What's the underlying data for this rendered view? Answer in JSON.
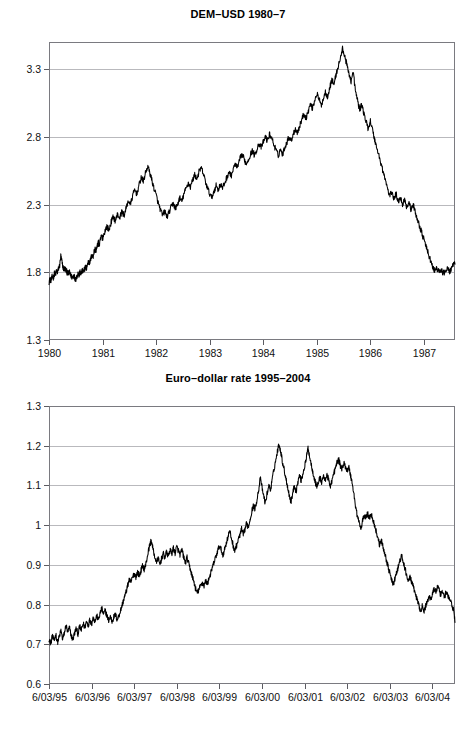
{
  "chart_data": [
    {
      "id": "dem-usd",
      "type": "line",
      "title": "DEM–USD 1980–7",
      "xlabel": "",
      "ylabel": "",
      "grid": true,
      "legend": "none",
      "xlim": [
        1980.0,
        1987.58
      ],
      "ylim": [
        1.3,
        3.5
      ],
      "ytick_labels": [
        "3.3",
        "2.8",
        "2.3",
        "1.8",
        "1.3"
      ],
      "ytick_values": [
        3.3,
        2.8,
        2.3,
        1.8,
        1.3
      ],
      "xtick_labels": [
        "1980",
        "1981",
        "1982",
        "1983",
        "1984",
        "1985",
        "1986",
        "1987"
      ],
      "xtick_values": [
        1980,
        1981,
        1982,
        1983,
        1984,
        1985,
        1986,
        1987
      ],
      "series": [
        {
          "name": "DEM per USD",
          "x": [
            1980.0,
            1980.02,
            1980.04,
            1980.06,
            1980.08,
            1980.1,
            1980.12,
            1980.14,
            1980.16,
            1980.18,
            1980.2,
            1980.22,
            1980.24,
            1980.26,
            1980.28,
            1980.3,
            1980.32,
            1980.34,
            1980.36,
            1980.38,
            1980.4,
            1980.42,
            1980.44,
            1980.46,
            1980.48,
            1980.5,
            1980.52,
            1980.54,
            1980.56,
            1980.58,
            1980.6,
            1980.62,
            1980.64,
            1980.66,
            1980.68,
            1980.7,
            1980.72,
            1980.74,
            1980.76,
            1980.78,
            1980.8,
            1980.82,
            1980.84,
            1980.86,
            1980.88,
            1980.9,
            1980.92,
            1980.94,
            1980.96,
            1980.98,
            1981.0,
            1981.04,
            1981.08,
            1981.12,
            1981.16,
            1981.2,
            1981.24,
            1981.28,
            1981.32,
            1981.36,
            1981.4,
            1981.44,
            1981.48,
            1981.52,
            1981.56,
            1981.6,
            1981.64,
            1981.68,
            1981.72,
            1981.76,
            1981.8,
            1981.84,
            1981.88,
            1981.92,
            1981.96,
            1982.0,
            1982.04,
            1982.08,
            1982.12,
            1982.16,
            1982.2,
            1982.24,
            1982.28,
            1982.32,
            1982.36,
            1982.4,
            1982.44,
            1982.48,
            1982.52,
            1982.56,
            1982.6,
            1982.64,
            1982.68,
            1982.72,
            1982.76,
            1982.8,
            1982.84,
            1982.88,
            1982.92,
            1982.96,
            1983.0,
            1983.04,
            1983.08,
            1983.12,
            1983.16,
            1983.2,
            1983.24,
            1983.28,
            1983.32,
            1983.36,
            1983.4,
            1983.44,
            1983.48,
            1983.52,
            1983.56,
            1983.6,
            1983.64,
            1983.68,
            1983.72,
            1983.76,
            1983.8,
            1983.84,
            1983.88,
            1983.92,
            1983.96,
            1984.0,
            1984.04,
            1984.08,
            1984.12,
            1984.16,
            1984.2,
            1984.24,
            1984.28,
            1984.32,
            1984.36,
            1984.4,
            1984.44,
            1984.48,
            1984.52,
            1984.56,
            1984.6,
            1984.64,
            1984.68,
            1984.72,
            1984.76,
            1984.8,
            1984.84,
            1984.88,
            1984.92,
            1984.96,
            1985.0,
            1985.04,
            1985.08,
            1985.12,
            1985.16,
            1985.2,
            1985.24,
            1985.28,
            1985.32,
            1985.36,
            1985.4,
            1985.44,
            1985.48,
            1985.52,
            1985.56,
            1985.6,
            1985.64,
            1985.68,
            1985.72,
            1985.76,
            1985.8,
            1985.84,
            1985.88,
            1985.92,
            1985.96,
            1986.0,
            1986.04,
            1986.08,
            1986.12,
            1986.16,
            1986.2,
            1986.24,
            1986.28,
            1986.32,
            1986.36,
            1986.4,
            1986.44,
            1986.48,
            1986.52,
            1986.56,
            1986.6,
            1986.64,
            1986.68,
            1986.72,
            1986.76,
            1986.8,
            1986.84,
            1986.88,
            1986.92,
            1986.96,
            1987.0,
            1987.04,
            1987.08,
            1987.12,
            1987.16,
            1987.2,
            1987.24,
            1987.28,
            1987.32,
            1987.36,
            1987.4,
            1987.44,
            1987.48,
            1987.52,
            1987.58
          ],
          "y": [
            1.73,
            1.75,
            1.74,
            1.77,
            1.76,
            1.79,
            1.78,
            1.81,
            1.8,
            1.83,
            1.85,
            1.92,
            1.88,
            1.84,
            1.82,
            1.83,
            1.81,
            1.8,
            1.79,
            1.8,
            1.78,
            1.77,
            1.76,
            1.78,
            1.76,
            1.75,
            1.77,
            1.79,
            1.78,
            1.8,
            1.79,
            1.81,
            1.8,
            1.82,
            1.84,
            1.83,
            1.86,
            1.88,
            1.87,
            1.9,
            1.93,
            1.91,
            1.95,
            1.97,
            1.96,
            1.99,
            2.02,
            2.0,
            2.04,
            2.07,
            2.05,
            2.1,
            2.14,
            2.11,
            2.17,
            2.21,
            2.18,
            2.23,
            2.2,
            2.25,
            2.22,
            2.27,
            2.33,
            2.3,
            2.36,
            2.41,
            2.38,
            2.44,
            2.5,
            2.47,
            2.53,
            2.58,
            2.54,
            2.48,
            2.42,
            2.37,
            2.31,
            2.26,
            2.22,
            2.25,
            2.21,
            2.24,
            2.28,
            2.31,
            2.27,
            2.3,
            2.35,
            2.32,
            2.38,
            2.42,
            2.46,
            2.43,
            2.48,
            2.52,
            2.49,
            2.54,
            2.57,
            2.53,
            2.47,
            2.42,
            2.38,
            2.35,
            2.4,
            2.44,
            2.41,
            2.45,
            2.42,
            2.46,
            2.5,
            2.54,
            2.51,
            2.56,
            2.6,
            2.57,
            2.63,
            2.67,
            2.64,
            2.6,
            2.63,
            2.67,
            2.7,
            2.66,
            2.71,
            2.75,
            2.72,
            2.76,
            2.8,
            2.77,
            2.82,
            2.79,
            2.74,
            2.7,
            2.66,
            2.71,
            2.67,
            2.72,
            2.76,
            2.8,
            2.77,
            2.82,
            2.86,
            2.83,
            2.88,
            2.93,
            2.97,
            2.94,
            2.99,
            3.04,
            3.01,
            3.07,
            3.12,
            3.08,
            3.03,
            3.08,
            3.13,
            3.1,
            3.16,
            3.22,
            3.19,
            3.26,
            3.32,
            3.38,
            3.45,
            3.4,
            3.33,
            3.27,
            3.21,
            3.28,
            3.14,
            3.07,
            3.0,
            3.04,
            2.97,
            2.91,
            2.86,
            2.92,
            2.85,
            2.78,
            2.72,
            2.66,
            2.6,
            2.54,
            2.48,
            2.42,
            2.36,
            2.4,
            2.34,
            2.38,
            2.32,
            2.36,
            2.3,
            2.34,
            2.28,
            2.32,
            2.26,
            2.3,
            2.24,
            2.19,
            2.14,
            2.09,
            2.04,
            1.99,
            1.94,
            1.89,
            1.84,
            1.81,
            1.83,
            1.8,
            1.82,
            1.79,
            1.81,
            1.83,
            1.8,
            1.84,
            1.86
          ]
        }
      ]
    },
    {
      "id": "euro-dollar",
      "type": "line",
      "title": "Euro–dollar rate 1995–2004",
      "xlabel": "",
      "ylabel": "",
      "grid": true,
      "legend": "none",
      "xlim": [
        1995.42,
        2004.95
      ],
      "ylim": [
        0.6,
        1.3
      ],
      "ytick_labels": [
        "1.3",
        "1.2",
        "1.1",
        "1",
        "0.9",
        "0.8",
        "0.7",
        "0.6"
      ],
      "ytick_values": [
        1.3,
        1.2,
        1.1,
        1.0,
        0.9,
        0.8,
        0.7,
        0.6
      ],
      "xtick_labels": [
        "6/03/95",
        "6/03/96",
        "6/03/97",
        "6/03/98",
        "6/03/99",
        "6/03/00",
        "6/03/01",
        "6/03/02",
        "6/03/03",
        "6/03/04"
      ],
      "xtick_values": [
        1995.42,
        1996.42,
        1997.42,
        1998.42,
        1999.42,
        2000.42,
        2001.42,
        2002.42,
        2003.42,
        2004.42
      ],
      "series": [
        {
          "name": "EUR per USD (synthetic pre-1999)",
          "x": [
            1995.42,
            1995.46,
            1995.5,
            1995.54,
            1995.58,
            1995.62,
            1995.66,
            1995.7,
            1995.74,
            1995.78,
            1995.82,
            1995.86,
            1995.9,
            1995.94,
            1995.98,
            1996.02,
            1996.06,
            1996.1,
            1996.14,
            1996.18,
            1996.22,
            1996.26,
            1996.3,
            1996.34,
            1996.38,
            1996.42,
            1996.46,
            1996.5,
            1996.54,
            1996.58,
            1996.62,
            1996.66,
            1996.7,
            1996.74,
            1996.78,
            1996.82,
            1996.86,
            1996.9,
            1996.94,
            1996.98,
            1997.02,
            1997.06,
            1997.1,
            1997.14,
            1997.18,
            1997.22,
            1997.26,
            1997.3,
            1997.34,
            1997.38,
            1997.42,
            1997.46,
            1997.5,
            1997.54,
            1997.58,
            1997.62,
            1997.66,
            1997.7,
            1997.74,
            1997.78,
            1997.82,
            1997.86,
            1997.9,
            1997.94,
            1997.98,
            1998.02,
            1998.06,
            1998.1,
            1998.14,
            1998.18,
            1998.22,
            1998.26,
            1998.3,
            1998.34,
            1998.38,
            1998.42,
            1998.46,
            1998.5,
            1998.54,
            1998.58,
            1998.62,
            1998.66,
            1998.7,
            1998.74,
            1998.78,
            1998.82,
            1998.86,
            1998.9,
            1998.94,
            1998.98,
            1999.02,
            1999.06,
            1999.1,
            1999.14,
            1999.18,
            1999.22,
            1999.26,
            1999.3,
            1999.34,
            1999.38,
            1999.42,
            1999.46,
            1999.5,
            1999.54,
            1999.58,
            1999.62,
            1999.66,
            1999.7,
            1999.74,
            1999.78,
            1999.82,
            1999.86,
            1999.9,
            1999.94,
            1999.98,
            2000.02,
            2000.06,
            2000.1,
            2000.14,
            2000.18,
            2000.22,
            2000.26,
            2000.3,
            2000.34,
            2000.38,
            2000.42,
            2000.46,
            2000.5,
            2000.54,
            2000.58,
            2000.62,
            2000.66,
            2000.7,
            2000.74,
            2000.78,
            2000.82,
            2000.86,
            2000.9,
            2000.94,
            2000.98,
            2001.02,
            2001.06,
            2001.1,
            2001.14,
            2001.18,
            2001.22,
            2001.26,
            2001.3,
            2001.34,
            2001.38,
            2001.42,
            2001.46,
            2001.5,
            2001.54,
            2001.58,
            2001.62,
            2001.66,
            2001.7,
            2001.74,
            2001.78,
            2001.82,
            2001.86,
            2001.9,
            2001.94,
            2001.98,
            2002.02,
            2002.06,
            2002.1,
            2002.14,
            2002.18,
            2002.22,
            2002.26,
            2002.3,
            2002.34,
            2002.38,
            2002.42,
            2002.46,
            2002.5,
            2002.54,
            2002.58,
            2002.62,
            2002.66,
            2002.7,
            2002.74,
            2002.78,
            2002.82,
            2002.86,
            2002.9,
            2002.94,
            2002.98,
            2003.02,
            2003.06,
            2003.1,
            2003.14,
            2003.18,
            2003.22,
            2003.26,
            2003.3,
            2003.34,
            2003.38,
            2003.42,
            2003.46,
            2003.5,
            2003.54,
            2003.58,
            2003.62,
            2003.66,
            2003.7,
            2003.74,
            2003.78,
            2003.82,
            2003.86,
            2003.9,
            2003.94,
            2003.98,
            2004.02,
            2004.06,
            2004.1,
            2004.14,
            2004.18,
            2004.22,
            2004.26,
            2004.3,
            2004.34,
            2004.38,
            2004.42,
            2004.46,
            2004.5,
            2004.54,
            2004.58,
            2004.62,
            2004.66,
            2004.7,
            2004.74,
            2004.8,
            2004.86,
            2004.92,
            2004.95
          ],
          "y": [
            0.715,
            0.7,
            0.722,
            0.708,
            0.725,
            0.705,
            0.718,
            0.735,
            0.712,
            0.728,
            0.748,
            0.73,
            0.742,
            0.722,
            0.712,
            0.728,
            0.74,
            0.726,
            0.745,
            0.735,
            0.752,
            0.742,
            0.758,
            0.748,
            0.762,
            0.752,
            0.768,
            0.758,
            0.772,
            0.762,
            0.778,
            0.79,
            0.775,
            0.785,
            0.772,
            0.76,
            0.77,
            0.758,
            0.768,
            0.775,
            0.762,
            0.772,
            0.785,
            0.8,
            0.815,
            0.828,
            0.845,
            0.862,
            0.855,
            0.868,
            0.878,
            0.87,
            0.882,
            0.872,
            0.886,
            0.898,
            0.888,
            0.905,
            0.928,
            0.948,
            0.962,
            0.94,
            0.922,
            0.905,
            0.918,
            0.9,
            0.915,
            0.928,
            0.918,
            0.932,
            0.922,
            0.938,
            0.928,
            0.942,
            0.93,
            0.945,
            0.935,
            0.925,
            0.938,
            0.92,
            0.905,
            0.918,
            0.902,
            0.888,
            0.872,
            0.858,
            0.84,
            0.828,
            0.838,
            0.848,
            0.855,
            0.848,
            0.86,
            0.852,
            0.868,
            0.88,
            0.895,
            0.908,
            0.922,
            0.935,
            0.948,
            0.938,
            0.925,
            0.938,
            0.955,
            0.97,
            0.985,
            0.968,
            0.95,
            0.935,
            0.948,
            0.962,
            0.975,
            0.99,
            0.975,
            0.99,
            1.005,
            0.995,
            1.015,
            1.035,
            1.05,
            1.04,
            1.065,
            1.088,
            1.118,
            1.095,
            1.072,
            1.055,
            1.08,
            1.1,
            1.088,
            1.115,
            1.14,
            1.162,
            1.185,
            1.205,
            1.185,
            1.16,
            1.14,
            1.118,
            1.098,
            1.075,
            1.058,
            1.08,
            1.1,
            1.085,
            1.108,
            1.125,
            1.112,
            1.13,
            1.148,
            1.168,
            1.195,
            1.172,
            1.15,
            1.132,
            1.112,
            1.098,
            1.105,
            1.12,
            1.108,
            1.125,
            1.112,
            1.128,
            1.115,
            1.098,
            1.112,
            1.128,
            1.142,
            1.158,
            1.165,
            1.15,
            1.142,
            1.155,
            1.148,
            1.138,
            1.145,
            1.125,
            1.105,
            1.075,
            1.045,
            1.022,
            1.008,
            0.988,
            1.01,
            1.025,
            1.02,
            1.028,
            1.018,
            1.03,
            1.015,
            1.0,
            0.985,
            0.968,
            0.95,
            0.962,
            0.945,
            0.93,
            0.912,
            0.895,
            0.878,
            0.862,
            0.85,
            0.865,
            0.88,
            0.895,
            0.912,
            0.922,
            0.905,
            0.888,
            0.872,
            0.858,
            0.87,
            0.855,
            0.84,
            0.828,
            0.812,
            0.798,
            0.785,
            0.795,
            0.782,
            0.795,
            0.808,
            0.822,
            0.812,
            0.828,
            0.84,
            0.832,
            0.845,
            0.835,
            0.822,
            0.832,
            0.82,
            0.83,
            0.818,
            0.805,
            0.785,
            0.755
          ]
        }
      ]
    }
  ]
}
